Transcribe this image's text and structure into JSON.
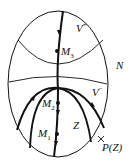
{
  "diagram": {
    "type": "phase-portrait",
    "colors": {
      "stroke": "#111111",
      "background": "#ffffff"
    },
    "region_label": "N",
    "labels": {
      "v_plus": {
        "base": "V",
        "sup": "+"
      },
      "v_minus": {
        "base": "V",
        "sup": "−"
      },
      "m3": {
        "base": "M",
        "sub": "3"
      },
      "m2": {
        "base": "M",
        "sub": "2"
      },
      "m1": {
        "base": "M",
        "sub": "1"
      },
      "z": "Z",
      "pz": "P(Z)",
      "n": "N"
    },
    "points": [
      {
        "name": "M3",
        "x": 57,
        "y": 51
      },
      {
        "name": "M2",
        "x": 58,
        "y": 103
      },
      {
        "name": "M1",
        "x": 57,
        "y": 134
      }
    ]
  }
}
